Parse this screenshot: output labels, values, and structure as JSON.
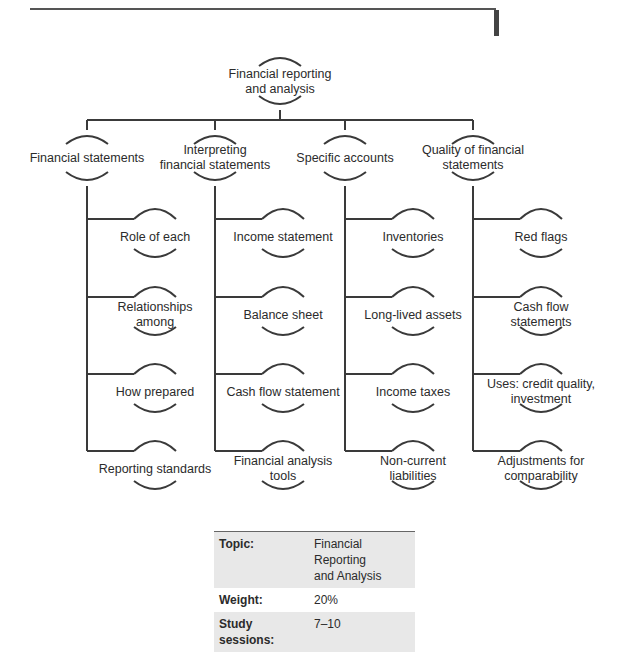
{
  "root": {
    "label_line1": "Financial reporting",
    "label_line2": "and analysis"
  },
  "branches": [
    {
      "label_line1": "Financial statements",
      "label_line2": "",
      "children": [
        [
          "Role of each",
          ""
        ],
        [
          "Relationships",
          "among"
        ],
        [
          "How prepared",
          ""
        ],
        [
          "Reporting standards",
          ""
        ]
      ]
    },
    {
      "label_line1": "Interpreting",
      "label_line2": "financial statements",
      "children": [
        [
          "Income statement",
          ""
        ],
        [
          "Balance sheet",
          ""
        ],
        [
          "Cash flow statement",
          ""
        ],
        [
          "Financial analysis",
          "tools"
        ]
      ]
    },
    {
      "label_line1": "Specific accounts",
      "label_line2": "",
      "children": [
        [
          "Inventories",
          ""
        ],
        [
          "Long-lived assets",
          ""
        ],
        [
          "Income taxes",
          ""
        ],
        [
          "Non-current",
          "liabilities"
        ]
      ]
    },
    {
      "label_line1": "Quality of financial",
      "label_line2": "statements",
      "children": [
        [
          "Red flags",
          ""
        ],
        [
          "Cash flow",
          "statements"
        ],
        [
          "Uses: credit quality,",
          "investment"
        ],
        [
          "Adjustments for",
          "comparability"
        ]
      ]
    }
  ],
  "info_table": {
    "topic_key": "Topic:",
    "topic_value_line1": "Financial Reporting",
    "topic_value_line2": "and Analysis",
    "weight_key": "Weight:",
    "weight_value": "20%",
    "sessions_key": "Study sessions:",
    "sessions_value": "7–10"
  },
  "colors": {
    "line": "#3a3a3a",
    "table_shade": "#e8e8e8"
  }
}
